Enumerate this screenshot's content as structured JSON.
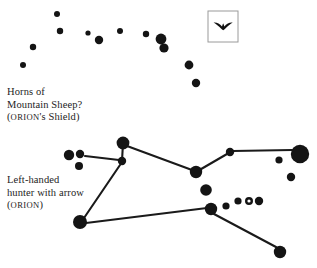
{
  "figure": {
    "background_color": "#ffffff",
    "star_color": "#141414",
    "line_color": "#1a1a1a",
    "width": 317,
    "height": 268
  },
  "captions": {
    "shield": {
      "line1": "Horns of",
      "line2": "Mountain Sheep?",
      "line3_open": "(",
      "line3_smallcaps": "ORION",
      "line3_rest": "'s Shield)"
    },
    "orion": {
      "line1": "Left-handed",
      "line2": "hunter with arrow",
      "line3_open": "(",
      "line3_smallcaps": "ORION",
      "line3_rest": ")"
    }
  },
  "bird_box": {
    "label": "bird-glyph-box",
    "x": 208,
    "y": 11,
    "width": 30,
    "height": 31,
    "border_color": "#9a9a9a",
    "glyph_color": "#111111"
  },
  "chart_data": {
    "type": "scatter",
    "xlabel": "",
    "ylabel": "",
    "xlim": [
      0,
      317
    ],
    "ylim": [
      0,
      268
    ],
    "grid": false,
    "legend": false,
    "series": [
      {
        "name": "Horns of Mountain Sheep? (ORION's Shield)",
        "stars": [
          {
            "x": 57,
            "y": 14,
            "r": 3.0,
            "filled": true
          },
          {
            "x": 60,
            "y": 31,
            "r": 3.2,
            "filled": true
          },
          {
            "x": 33,
            "y": 47,
            "r": 3.2,
            "filled": true
          },
          {
            "x": 23,
            "y": 65,
            "r": 3.0,
            "filled": true
          },
          {
            "x": 88,
            "y": 33,
            "r": 2.6,
            "filled": true
          },
          {
            "x": 99,
            "y": 40,
            "r": 4.2,
            "filled": true
          },
          {
            "x": 120,
            "y": 31,
            "r": 3.0,
            "filled": true
          },
          {
            "x": 146,
            "y": 34,
            "r": 3.2,
            "filled": true
          },
          {
            "x": 161,
            "y": 39,
            "r": 5.4,
            "filled": true
          },
          {
            "x": 164,
            "y": 48,
            "r": 4.6,
            "filled": true
          },
          {
            "x": 189,
            "y": 65,
            "r": 4.4,
            "filled": true
          },
          {
            "x": 196,
            "y": 83,
            "r": 4.2,
            "filled": true
          }
        ],
        "lines": []
      },
      {
        "name": "Left-handed hunter with arrow (ORION)",
        "stars": [
          {
            "x": 69,
            "y": 155,
            "r": 5.2,
            "filled": true
          },
          {
            "x": 80,
            "y": 154,
            "r": 4.2,
            "filled": true
          },
          {
            "x": 79,
            "y": 166,
            "r": 4.0,
            "filled": true
          },
          {
            "x": 123,
            "y": 143,
            "r": 6.4,
            "filled": true
          },
          {
            "x": 122,
            "y": 161,
            "r": 4.2,
            "filled": true
          },
          {
            "x": 196,
            "y": 172,
            "r": 6.2,
            "filled": true
          },
          {
            "x": 230,
            "y": 152,
            "r": 4.2,
            "filled": true
          },
          {
            "x": 300,
            "y": 154,
            "r": 9.2,
            "filled": true
          },
          {
            "x": 279,
            "y": 160,
            "r": 3.6,
            "filled": true
          },
          {
            "x": 291,
            "y": 177,
            "r": 4.2,
            "filled": true
          },
          {
            "x": 206,
            "y": 190,
            "r": 5.8,
            "filled": true
          },
          {
            "x": 211,
            "y": 209,
            "r": 6.2,
            "filled": true
          },
          {
            "x": 226,
            "y": 206,
            "r": 3.6,
            "filled": true
          },
          {
            "x": 238,
            "y": 201,
            "r": 3.6,
            "filled": true
          },
          {
            "x": 249,
            "y": 201,
            "r": 4.0,
            "filled": false
          },
          {
            "x": 259,
            "y": 201,
            "r": 4.2,
            "filled": true
          },
          {
            "x": 80,
            "y": 222,
            "r": 7.0,
            "filled": true
          },
          {
            "x": 280,
            "y": 252,
            "r": 6.2,
            "filled": true
          }
        ],
        "lines": [
          {
            "x1": 85,
            "y1": 156,
            "x2": 119,
            "y2": 160
          },
          {
            "x1": 122,
            "y1": 161,
            "x2": 123,
            "y2": 143
          },
          {
            "x1": 127,
            "y1": 146,
            "x2": 192,
            "y2": 170
          },
          {
            "x1": 196,
            "y1": 172,
            "x2": 227,
            "y2": 154
          },
          {
            "x1": 233,
            "y1": 151,
            "x2": 292,
            "y2": 150
          },
          {
            "x1": 120,
            "y1": 165,
            "x2": 84,
            "y2": 218
          },
          {
            "x1": 86,
            "y1": 223,
            "x2": 207,
            "y2": 208
          },
          {
            "x1": 214,
            "y1": 214,
            "x2": 276,
            "y2": 247
          }
        ]
      }
    ]
  }
}
